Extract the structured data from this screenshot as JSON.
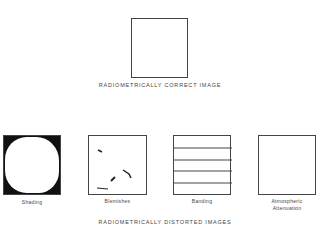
{
  "top": {
    "caption": "RADIOMETRICALLY CORRECT IMAGE"
  },
  "bottom": {
    "caption": "RADIOMETRICALLY DISTORTED IMAGES",
    "panels": [
      {
        "label": "Shading"
      },
      {
        "label": "Blemishes"
      },
      {
        "label": "Banding"
      },
      {
        "label": "Atmospheric",
        "label2": "Attenuation"
      }
    ]
  }
}
